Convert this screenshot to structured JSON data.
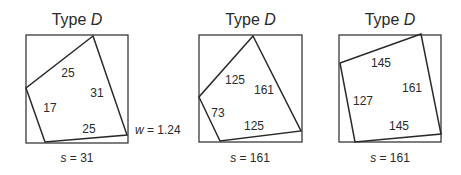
{
  "panels": [
    {
      "title_prefix": "Type ",
      "title_var": "D",
      "outer": {
        "x": 26,
        "y": 35,
        "w": 102,
        "h": 108
      },
      "inner_points": "93,36 26,88 45,142 127,135",
      "labels": [
        {
          "text": "25",
          "x": 68,
          "y": 77
        },
        {
          "text": "31",
          "x": 97,
          "y": 97
        },
        {
          "text": "17",
          "x": 50,
          "y": 112
        },
        {
          "text": "25",
          "x": 89,
          "y": 133
        }
      ],
      "caption_var": "s",
      "caption_rest": " = 31",
      "caption_x": 77,
      "caption_y": 162
    },
    {
      "title_prefix": "Type ",
      "title_var": "D",
      "outer": {
        "x": 199,
        "y": 35,
        "w": 103,
        "h": 107
      },
      "inner_points": "253,36 199,97 220,141 301,131",
      "labels": [
        {
          "text": "125",
          "x": 235,
          "y": 84
        },
        {
          "text": "161",
          "x": 264,
          "y": 94
        },
        {
          "text": "73",
          "x": 218,
          "y": 117
        },
        {
          "text": "125",
          "x": 254,
          "y": 130
        }
      ],
      "caption_var": "s",
      "caption_rest": " = 161",
      "caption_x": 250,
      "caption_y": 162
    },
    {
      "title_prefix": "Type ",
      "title_var": "D",
      "outer": {
        "x": 339,
        "y": 35,
        "w": 102,
        "h": 107
      },
      "inner_points": "421,34 340,63 355,142 441,134",
      "labels": [
        {
          "text": "145",
          "x": 381,
          "y": 67
        },
        {
          "text": "161",
          "x": 412,
          "y": 92
        },
        {
          "text": "127",
          "x": 363,
          "y": 105
        },
        {
          "text": "145",
          "x": 399,
          "y": 130
        }
      ],
      "caption_var": "s",
      "caption_rest": " = 161",
      "caption_x": 390,
      "caption_y": 162
    }
  ],
  "annotation": {
    "var": "w",
    "rest": " = 1.24",
    "x": 135,
    "y": 134
  }
}
